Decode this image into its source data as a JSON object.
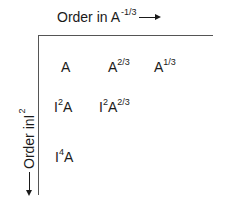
{
  "diagram": {
    "top_axis": {
      "label_prefix": "Order in ",
      "variable": "A",
      "exponent": "-1/3",
      "direction": "right-arrow"
    },
    "left_axis": {
      "label_prefix": "Order in ",
      "variable": "I",
      "exponent": "2",
      "direction": "down-arrow"
    },
    "cells": [
      {
        "row": 0,
        "col": 0,
        "parts": [
          {
            "base": "A",
            "sup": ""
          }
        ]
      },
      {
        "row": 0,
        "col": 1,
        "parts": [
          {
            "base": "A",
            "sup": "2/3"
          }
        ]
      },
      {
        "row": 0,
        "col": 2,
        "parts": [
          {
            "base": "A",
            "sup": "1/3"
          }
        ]
      },
      {
        "row": 1,
        "col": 0,
        "parts": [
          {
            "base": "I",
            "sup": "2"
          },
          {
            "base": "A",
            "sup": ""
          }
        ]
      },
      {
        "row": 1,
        "col": 1,
        "parts": [
          {
            "base": "I",
            "sup": "2"
          },
          {
            "base": "A",
            "sup": "2/3"
          }
        ]
      },
      {
        "row": 2,
        "col": 0,
        "parts": [
          {
            "base": "I",
            "sup": "4"
          },
          {
            "base": "A",
            "sup": ""
          }
        ]
      }
    ]
  }
}
